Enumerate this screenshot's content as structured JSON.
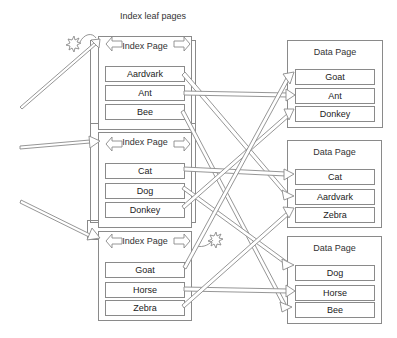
{
  "title": "Index leaf pages",
  "index_pages": [
    {
      "title": "Index Page",
      "entries": [
        "Aardvark",
        "Ant",
        "Bee"
      ]
    },
    {
      "title": "Index Page",
      "entries": [
        "Cat",
        "Dog",
        "Donkey"
      ]
    },
    {
      "title": "Index Page",
      "entries": [
        "Goat",
        "Horse",
        "Zebra"
      ]
    }
  ],
  "data_pages": [
    {
      "title": "Data Page",
      "entries": [
        "Goat",
        "Ant",
        "Donkey"
      ]
    },
    {
      "title": "Data Page",
      "entries": [
        "Cat",
        "Aardvark",
        "Zebra"
      ]
    },
    {
      "title": "Data Page",
      "entries": [
        "Dog",
        "Horse",
        "Bee"
      ]
    }
  ],
  "connections": [
    {
      "from": "Aardvark",
      "to_page": 2
    },
    {
      "from": "Ant",
      "to_page": 1
    },
    {
      "from": "Bee",
      "to_page": 3
    },
    {
      "from": "Cat",
      "to_page": 2
    },
    {
      "from": "Dog",
      "to_page": 3
    },
    {
      "from": "Donkey",
      "to_page": 1
    },
    {
      "from": "Goat",
      "to_page": 1
    },
    {
      "from": "Horse",
      "to_page": 3
    },
    {
      "from": "Zebra",
      "to_page": 2
    }
  ],
  "colors": {
    "stroke": "#8a8a8a",
    "background": "#ffffff"
  }
}
